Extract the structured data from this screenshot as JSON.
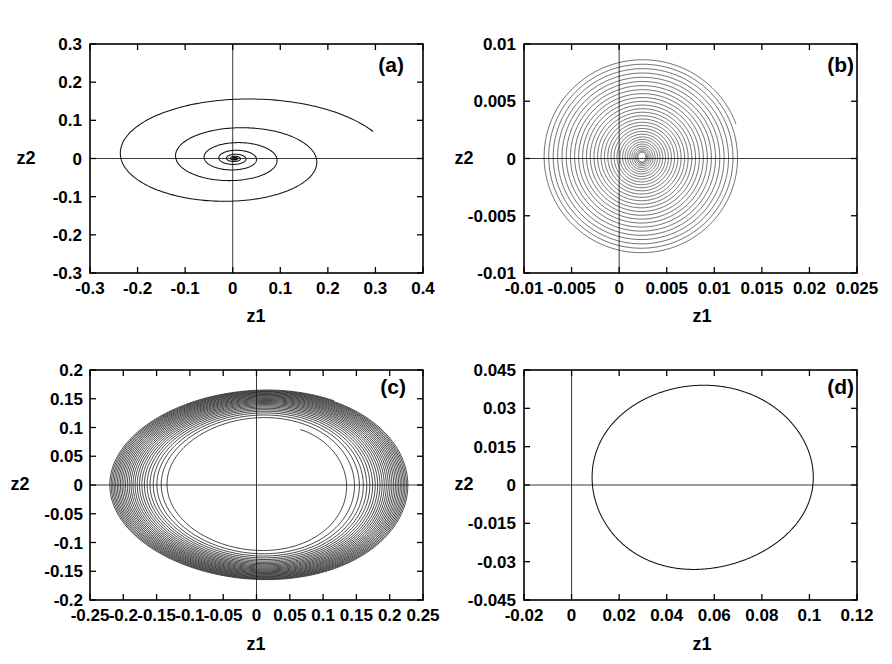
{
  "figure": {
    "axis_label_x": "z1",
    "axis_label_y": "z2",
    "background": "#ffffff",
    "line_color": "#111111"
  },
  "chart_data": [
    {
      "type": "line",
      "panel": "(a)",
      "title": "",
      "xlabel": "z1",
      "ylabel": "z2",
      "xlim": [
        -0.3,
        0.4
      ],
      "ylim": [
        -0.3,
        0.3
      ],
      "xticks": [
        -0.3,
        -0.2,
        -0.1,
        0,
        0.1,
        0.2,
        0.3,
        0.4
      ],
      "xticklabels": [
        "-0.3",
        "-0.2",
        "-0.1",
        "0",
        "0.1",
        "0.2",
        "0.3",
        "0.4"
      ],
      "yticks": [
        -0.3,
        -0.2,
        -0.1,
        0,
        0.1,
        0.2,
        0.3
      ],
      "yticklabels": [
        "-0.3",
        "-0.2",
        "-0.1",
        "0",
        "0.1",
        "0.2",
        "0.3"
      ],
      "grid": false,
      "legend": "none",
      "description": "Inward spiral trajectory converging to stable focus at origin",
      "series": [
        {
          "name": "trajectory",
          "kind": "decaying-spiral",
          "start_point": [
            0.262,
            0.122
          ],
          "end_point": [
            0.0,
            0.0
          ],
          "r0_x": 0.318,
          "r0_y": 0.175,
          "theta_start": 0.42,
          "theta_end": 46.0,
          "decay": 0.105,
          "center": [
            0.004,
            0.0
          ],
          "samples": 1500
        }
      ]
    },
    {
      "type": "line",
      "panel": "(b)",
      "title": "",
      "xlabel": "z1",
      "ylabel": "z2",
      "xlim": [
        -0.01,
        0.025
      ],
      "ylim": [
        -0.01,
        0.01
      ],
      "xticks": [
        -0.01,
        -0.005,
        0,
        0.005,
        0.01,
        0.015,
        0.02,
        0.025
      ],
      "xticklabels": [
        "-0.01",
        "-0.005",
        "0",
        "0.005",
        "0.01",
        "0.015",
        "0.02",
        "0.025"
      ],
      "yticks": [
        -0.01,
        -0.005,
        0,
        0.005,
        0.01
      ],
      "yticklabels": [
        "-0.01",
        "-0.005",
        "0",
        "0.005",
        "0.01"
      ],
      "grid": false,
      "legend": "none",
      "description": "Very dense spiral filling a disc, converging to focus near origin",
      "series": [
        {
          "name": "trajectory",
          "kind": "dense-spiral",
          "start_point": [
            0.0112,
            0.004
          ],
          "end_point": [
            0.0022,
            0.0002
          ],
          "r_outer_x": 0.0105,
          "r_outer_y": 0.0086,
          "r_inner_x": 0.0004,
          "r_inner_y": 0.0004,
          "center": [
            0.0024,
            0.0001
          ],
          "turns": 30,
          "samples": 6000
        }
      ]
    },
    {
      "type": "line",
      "panel": "(c)",
      "title": "",
      "xlabel": "z1",
      "ylabel": "z2",
      "xlim": [
        -0.25,
        0.25
      ],
      "ylim": [
        -0.2,
        0.2
      ],
      "xticks": [
        -0.25,
        -0.2,
        -0.15,
        -0.1,
        -0.05,
        0,
        0.05,
        0.1,
        0.15,
        0.2,
        0.25
      ],
      "xticklabels": [
        "-0.25",
        "-0.2",
        "-0.15",
        "-0.1",
        "-0.05",
        "0",
        "0.05",
        "0.1",
        "0.15",
        "0.2",
        "0.25"
      ],
      "yticks": [
        -0.2,
        -0.15,
        -0.1,
        -0.05,
        0,
        0.05,
        0.1,
        0.15,
        0.2
      ],
      "yticklabels": [
        "-0.2",
        "-0.15",
        "-0.1",
        "-0.05",
        "0",
        "0.05",
        "0.1",
        "0.15",
        "0.2"
      ],
      "grid": false,
      "legend": "none",
      "description": "Spiral converging inward onto a stable limit cycle forming a dark annulus",
      "series": [
        {
          "name": "trajectory",
          "kind": "annulus-spiral",
          "start_point": [
            0.108,
            0.115
          ],
          "r_outer_x": 0.225,
          "r_outer_y": 0.165,
          "r_inner_x": 0.125,
          "r_inner_y": 0.108,
          "center": [
            0.004,
            0.0
          ],
          "turns": 26,
          "samples": 6000
        }
      ]
    },
    {
      "type": "line",
      "panel": "(d)",
      "title": "",
      "xlabel": "z1",
      "ylabel": "z2",
      "xlim": [
        -0.02,
        0.12
      ],
      "ylim": [
        -0.045,
        0.045
      ],
      "xticks": [
        -0.02,
        0,
        0.02,
        0.04,
        0.06,
        0.08,
        0.1,
        0.12
      ],
      "xticklabels": [
        "-0.02",
        "0",
        "0.02",
        "0.04",
        "0.06",
        "0.08",
        "0.1",
        "0.12"
      ],
      "yticks": [
        -0.045,
        -0.03,
        -0.015,
        0,
        0.015,
        0.03,
        0.045
      ],
      "yticklabels": [
        "-0.045",
        "-0.03",
        "-0.015",
        "0",
        "0.015",
        "0.03",
        "0.045"
      ],
      "grid": false,
      "legend": "none",
      "description": "Single closed periodic orbit (limit cycle)",
      "series": [
        {
          "name": "limit-cycle",
          "kind": "closed-orbit",
          "center": [
            0.0535,
            0.003
          ],
          "r_x": 0.0465,
          "r_y": 0.036,
          "x_min": 0.007,
          "x_max": 0.1,
          "y_min": -0.033,
          "y_max": 0.039,
          "samples": 900
        }
      ]
    }
  ],
  "panels": [
    {
      "label": "(a)"
    },
    {
      "label": "(b)"
    },
    {
      "label": "(c)"
    },
    {
      "label": "(d)"
    }
  ]
}
